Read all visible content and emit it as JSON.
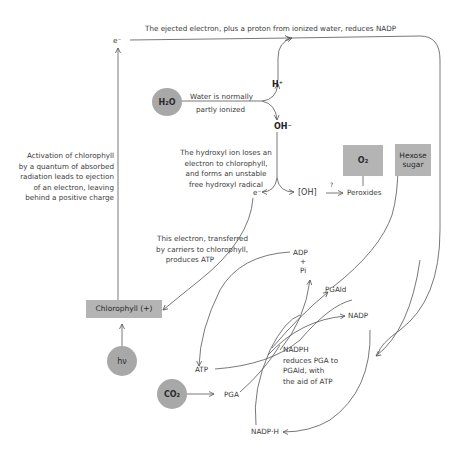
{
  "diagram": {
    "top_caption": "The ejected electron, plus a proton from ionized water, reduces NADP",
    "labels": {
      "e_top": "e⁻",
      "h_plus": "H⁺",
      "oh_minus": "OH⁻",
      "e_mid": "e⁻",
      "oh_radical": "[OH]",
      "question": "?",
      "peroxides": "Peroxides",
      "adp": "ADP",
      "plus": "+",
      "pi": "Pi",
      "pgald": "PGAld",
      "nadp": "NADP",
      "atp": "ATP",
      "pga": "PGA",
      "nadph_h": "NADP·H"
    },
    "nodes": {
      "h2o": "H₂O",
      "hv": "hν",
      "co2": "CO₂",
      "chlorophyll": "Chlorophyll (+)",
      "o2": "O₂",
      "hexose_line1": "Hexose",
      "hexose_line2": "sugar"
    },
    "annotations": {
      "water": [
        "Water is normally",
        "partly ionized"
      ],
      "activation": [
        "Activation of chlorophyll",
        "by a quantum of absorbed",
        "radiation leads to ejection",
        "of an electron, leaving",
        "behind a positive charge"
      ],
      "hydroxyl": [
        "The hydroxyl ion loses an",
        "electron to chlorophyll,",
        "and forms an unstable",
        "free hydroxyl radical"
      ],
      "electron_transfer": [
        "This electron, transferred",
        "by carriers to chlorophyll,",
        "produces ATP"
      ],
      "nadph": [
        "NADPH",
        "reduces PGA to",
        "PGAld, with",
        "the aid of ATP"
      ]
    },
    "colors": {
      "node_fill": "#a8a8a8",
      "box_fill": "#b4b4b4",
      "line": "#555555",
      "text": "#3a3a3a"
    }
  }
}
